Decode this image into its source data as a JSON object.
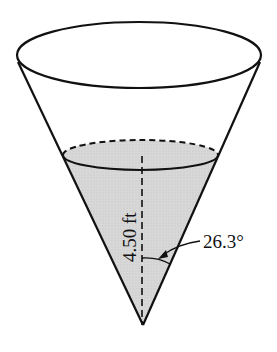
{
  "diagram": {
    "type": "conical-tank-with-liquid",
    "labels": {
      "height": "4.50 ft",
      "angle": "26.3°"
    },
    "colors": {
      "stroke": "#111111",
      "liquid_fill": "#d4d4d4",
      "background": "#ffffff"
    }
  }
}
